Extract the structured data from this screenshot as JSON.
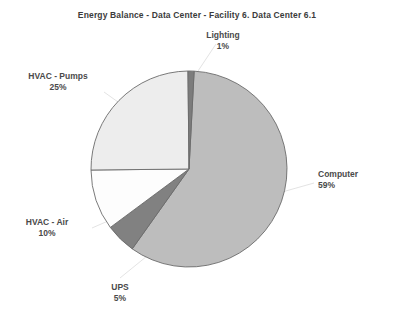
{
  "chart": {
    "title": "Energy Balance - Data Center - Facility 6. Data Center 6.1"
  },
  "labels": {
    "lighting": {
      "name": "Lighting",
      "pct": "1%"
    },
    "computer": {
      "name": "Computer",
      "pct": "59%"
    },
    "hvac_pumps": {
      "name": "HVAC - Pumps",
      "pct": "25%"
    },
    "hvac_air": {
      "name": "HVAC - Air",
      "pct": "10%"
    },
    "ups": {
      "name": "UPS",
      "pct": "5%"
    }
  },
  "chart_data": {
    "type": "pie",
    "title": "Energy Balance - Data Center - Facility 6. Data Center 6.1",
    "xlabel": "",
    "ylabel": "",
    "legend": "none",
    "labels_position": "outside-with-leader-lines",
    "start_angle_deg": 3,
    "direction": "clockwise",
    "categories": [
      "Computer",
      "UPS",
      "HVAC - Air",
      "HVAC - Pumps",
      "Lighting"
    ],
    "values": [
      59,
      5,
      10,
      25,
      1
    ],
    "value_unit": "percent",
    "total": 100,
    "colors": [
      "#bdbdbd",
      "#818181",
      "#fdfdfd",
      "#ededed",
      "#7c7c7c"
    ],
    "slice_border_color": "#6b6b6b",
    "slices": [
      {
        "label": "Computer",
        "value": 59,
        "display": "59%",
        "color": "#bdbdbd",
        "start_deg": 3,
        "end_deg": 215.4
      },
      {
        "label": "UPS",
        "value": 5,
        "display": "5%",
        "color": "#818181",
        "start_deg": 215.4,
        "end_deg": 233.4
      },
      {
        "label": "HVAC - Air",
        "value": 10,
        "display": "10%",
        "color": "#fdfdfd",
        "start_deg": 233.4,
        "end_deg": 269.4
      },
      {
        "label": "HVAC - Pumps",
        "value": 25,
        "display": "25%",
        "color": "#ededed",
        "start_deg": 269.4,
        "end_deg": 359.4
      },
      {
        "label": "Lighting",
        "value": 1,
        "display": "1%",
        "color": "#7c7c7c",
        "start_deg": 359.4,
        "end_deg": 363
      }
    ]
  }
}
